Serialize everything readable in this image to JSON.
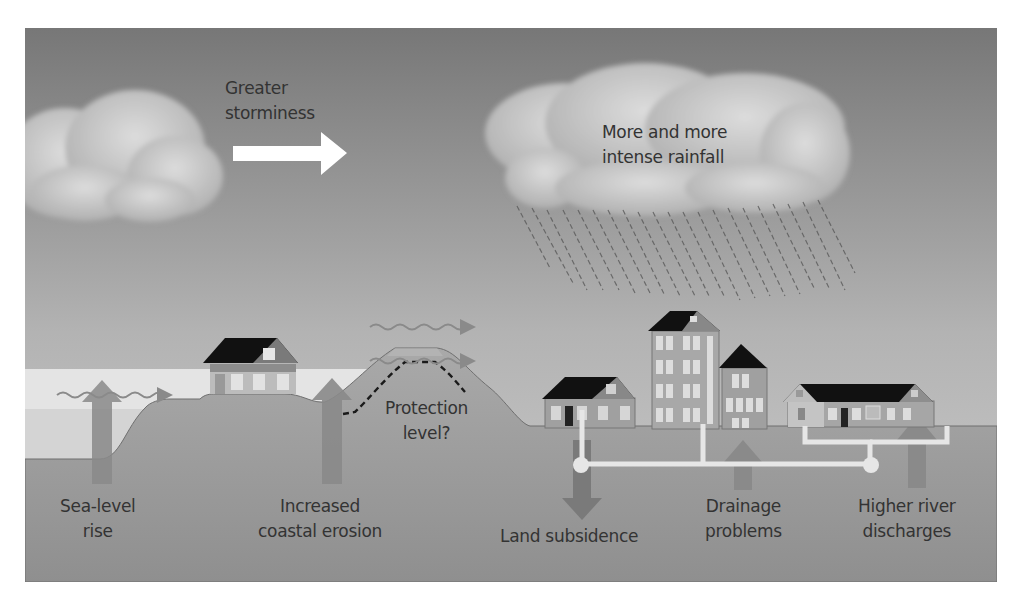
{
  "figure": {
    "labels": {
      "storminess": [
        "Greater",
        "storminess"
      ],
      "rainfall": [
        "More and more",
        "intense rainfall"
      ],
      "protection": [
        "Protection",
        "level?"
      ],
      "sea_level": [
        "Sea-level",
        "rise"
      ],
      "erosion": [
        "Increased",
        "coastal erosion"
      ],
      "subsidence": [
        "Land subsidence"
      ],
      "drainage": [
        "Drainage",
        "problems"
      ],
      "river": [
        "Higher river",
        "discharges"
      ]
    },
    "colors": {
      "sky_top": "#7a7a7a",
      "sky_bottom": "#c8c8c8",
      "sea_light": "#e6e6e6",
      "sea_mid": "#d2d2d2",
      "ground_top": "#a6a6a6",
      "ground_bottom": "#8e8e8e",
      "arrow": "#8a8a8a",
      "roof": "#111111",
      "text": "#333333"
    }
  }
}
